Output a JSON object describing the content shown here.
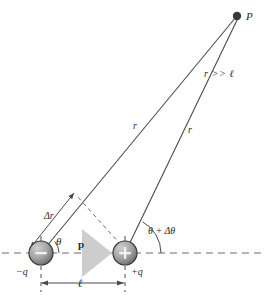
{
  "figure": {
    "type": "physics-diagram",
    "background_color": "#ffffff",
    "stroke_color": "#4a4a4a",
    "label_color": "#2b2b2b"
  },
  "labels": {
    "point_p": "P",
    "far_field_condition": "r >> ℓ",
    "r_left": "r",
    "r_right": "r",
    "delta_r": "Δr",
    "theta": "θ",
    "theta_plus_delta_theta": "θ + Δθ",
    "dipole_moment": "p",
    "charge_negative": "−q",
    "charge_positive": "+q",
    "separation": "ℓ",
    "sphere_negative_glyph": "−",
    "sphere_positive_glyph": "+"
  },
  "geometry": {
    "point_p": {
      "x": 237,
      "y": 16,
      "radius": 4
    },
    "charge_negative": {
      "x": 41,
      "y": 253,
      "radius": 12
    },
    "charge_positive": {
      "x": 125,
      "y": 253,
      "radius": 12
    },
    "axis_line": {
      "x1": 2,
      "y1": 253,
      "x2": 265,
      "y2": 253
    },
    "dipole_arrow": {
      "x1": 52,
      "y1": 253,
      "x2": 118,
      "y2": 253
    },
    "dimension_line": {
      "x1": 41,
      "y1": 283,
      "x2": 125,
      "y2": 283
    },
    "delta_r_segment": {
      "x1": 30,
      "y1": 246,
      "x2": 72,
      "y2": 194
    },
    "perpendicular_dashed": {
      "x1": 120,
      "y1": 244,
      "x2": 78,
      "y2": 196
    },
    "theta_arc_radius": 18,
    "theta_delta_arc_radius": 36
  },
  "colors": {
    "sphere_fill_light": "#b9b9b9",
    "sphere_fill_dark": "#6f6f6f",
    "sphere_stroke": "#3a3a3a",
    "dipole_arrow": "#d4d4d4",
    "line": "#4a4a4a",
    "dash": "#6a6a6a",
    "point_fill": "#3a3a3a"
  }
}
